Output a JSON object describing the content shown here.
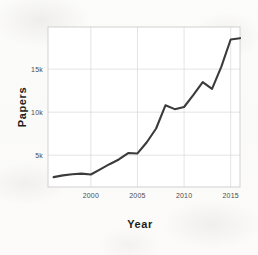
{
  "chart_data": {
    "type": "line",
    "title": "",
    "xlabel": "Year",
    "ylabel": "Papers",
    "xlim": [
      1995.4,
      2016.0
    ],
    "ylim": [
      1300,
      19900
    ],
    "grid": true,
    "legend": "none",
    "x_ticks": [
      {
        "value": 2000,
        "label": "2000"
      },
      {
        "value": 2005,
        "label": "2005"
      },
      {
        "value": 2010,
        "label": "2010"
      },
      {
        "value": 2015,
        "label": "2015"
      }
    ],
    "y_ticks": [
      {
        "value": 5000,
        "label": "5k"
      },
      {
        "value": 10000,
        "label": "10k"
      },
      {
        "value": 15000,
        "label": "15k"
      }
    ],
    "series": [
      {
        "name": "Papers",
        "color": "#3b3b3b",
        "x": [
          1996,
          1997,
          1998,
          1999,
          2000,
          2001,
          2002,
          2003,
          2004,
          2005,
          2006,
          2007,
          2008,
          2009,
          2010,
          2011,
          2012,
          2013,
          2014,
          2015,
          2016
        ],
        "values": [
          2450,
          2650,
          2780,
          2850,
          2750,
          3350,
          3950,
          4500,
          5250,
          5200,
          6500,
          8100,
          10800,
          10350,
          10600,
          12000,
          13500,
          12700,
          15300,
          18450,
          18600
        ]
      }
    ]
  },
  "axis_labels": {
    "x": "Year",
    "y": "Papers"
  },
  "colors": {
    "line": "#3b3b3b",
    "grid": "#d9d9d9",
    "frame": "#cdcdcd",
    "background": "#fbfbfa",
    "tick_text": "#4c4c4c",
    "axis_title": "#1d1d1d"
  }
}
